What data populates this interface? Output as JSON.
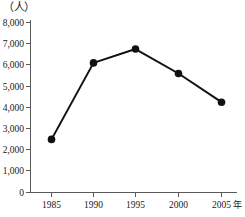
{
  "chart_data": {
    "type": "line",
    "title": "",
    "subtitle": "",
    "xlabel": "年",
    "ylabel": "（人）",
    "y_unit_label": "（人）",
    "x_axis_unit_suffix": "年",
    "categories": [
      "1985",
      "1990",
      "1995",
      "2000",
      "2005"
    ],
    "x": [
      1985,
      1990,
      1995,
      2000,
      2005
    ],
    "values": [
      2500,
      6100,
      6750,
      5600,
      4250
    ],
    "series": [
      {
        "name": "人数",
        "values": [
          2500,
          6100,
          6750,
          5600,
          4250
        ],
        "color": "#111111",
        "marker": "circle-filled"
      }
    ],
    "ylim": [
      0,
      8000
    ],
    "ytick_values": [
      0,
      1000,
      2000,
      3000,
      4000,
      5000,
      6000,
      7000,
      8000
    ],
    "ytick_labels": [
      "0",
      "1,000",
      "2,000",
      "3,000",
      "4,000",
      "5,000",
      "6,000",
      "7,000",
      "8,000"
    ],
    "xtick_labels": [
      "1985",
      "1990",
      "1995",
      "2000",
      "2005"
    ],
    "grid": false,
    "legend": false,
    "legend_position": "none",
    "annotations": []
  },
  "colors": {
    "background": "#ffffff",
    "line": "#111111",
    "marker": "#111111",
    "axis": "#5a5a5a",
    "text": "#1a1a1a"
  }
}
